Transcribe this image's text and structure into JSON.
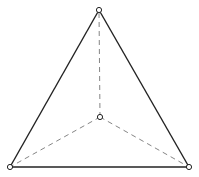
{
  "diagram": {
    "type": "tetrahedron-projection",
    "vertices": [
      {
        "id": "top",
        "x": 99,
        "y": 10
      },
      {
        "id": "bottom-left",
        "x": 10,
        "y": 167
      },
      {
        "id": "bottom-right",
        "x": 189,
        "y": 167
      },
      {
        "id": "center",
        "x": 100,
        "y": 117
      }
    ],
    "solid_edges": [
      [
        "top",
        "bottom-left"
      ],
      [
        "top",
        "bottom-right"
      ],
      [
        "bottom-left",
        "bottom-right"
      ]
    ],
    "dashed_edges": [
      [
        "center",
        "top"
      ],
      [
        "center",
        "bottom-left"
      ],
      [
        "center",
        "bottom-right"
      ]
    ],
    "colors": {
      "solid_edge": "#222222",
      "dashed_edge": "#777777",
      "vertex_fill": "#ffffff",
      "background": "#ffffff"
    }
  }
}
